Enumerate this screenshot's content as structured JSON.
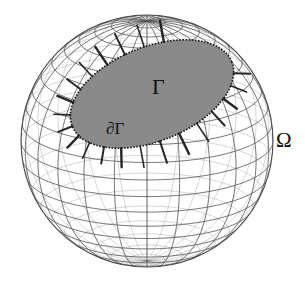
{
  "figure": {
    "kind": "diagram",
    "caption_labels": {
      "domain": "Ω",
      "surface_patch": "Γ",
      "patch_boundary": "∂Γ"
    },
    "background_color": "#ffffff",
    "sphere": {
      "name": "wireframe-sphere",
      "center_x": 147,
      "center_y": 141,
      "radius": 126,
      "mesh_line_color": "#555555",
      "outline_color": "#4a4a4a",
      "fill_color": "#ffffff",
      "meridian_count": 24,
      "parallel_count": 22,
      "tilt_degrees": 18
    },
    "patch": {
      "name": "gamma-patch",
      "fill_color": "#8a8a8a",
      "edge_color": "#111111",
      "center_x": 152,
      "center_y": 94,
      "semi_major": 86,
      "semi_minor": 47,
      "rotation_degrees": -22,
      "tick_count": 26,
      "tick_color": "#1a1a1a"
    },
    "labels": [
      {
        "id": "gamma",
        "text": "Γ",
        "x": 163,
        "y": 88,
        "font_size": 22
      },
      {
        "id": "dgamma",
        "text": "∂Γ",
        "x": 122,
        "y": 130,
        "font_size": 17
      },
      {
        "id": "omega",
        "text": "Ω",
        "x": 286,
        "y": 141,
        "font_size": 21
      }
    ]
  }
}
